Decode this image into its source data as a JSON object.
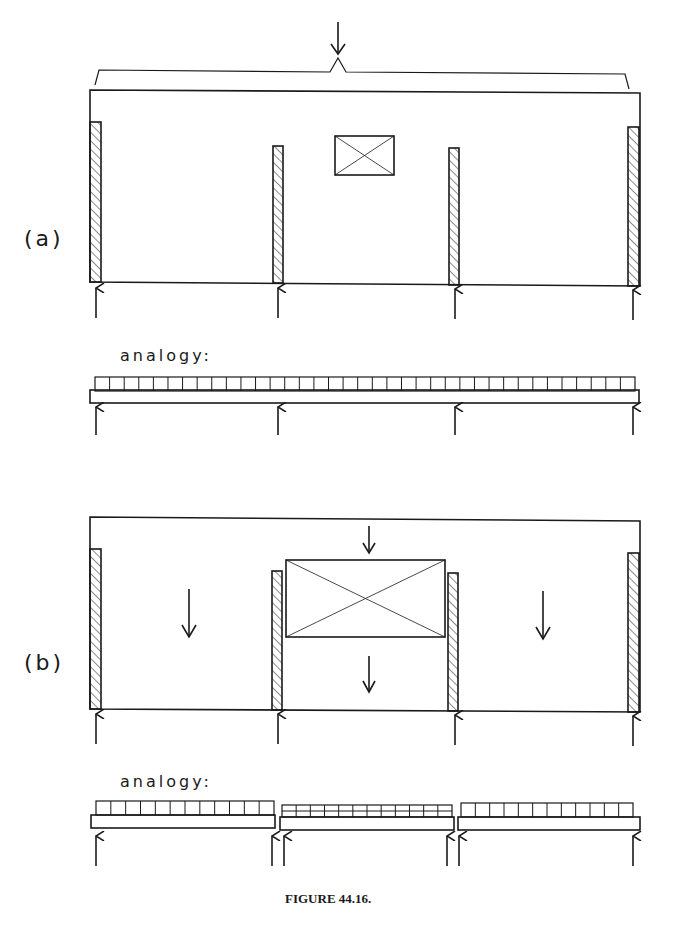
{
  "figure": {
    "caption": "FIGURE 44.16.",
    "parts": [
      {
        "id": "a",
        "label": "(a)",
        "description": "Wall panel on four supports with small opening; single distributed load over whole span",
        "analogy_label": "analogy:",
        "analogy": "Continuous beam with uniform load on four supports",
        "supports": 4
      },
      {
        "id": "b",
        "label": "(b)",
        "description": "Wall panel with large opening between inner piers; load splits into three separate spans",
        "analogy_label": "analogy:",
        "analogy": "Three simply supported beams, each on two supports; middle beam carries heavier load",
        "supports": 6
      }
    ]
  },
  "colors": {
    "stroke": "#1a1a1a",
    "background": "#ffffff"
  }
}
